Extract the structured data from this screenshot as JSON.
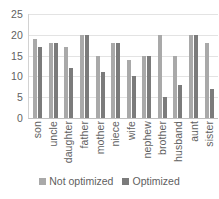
{
  "chart_data": {
    "type": "bar",
    "title": "",
    "xlabel": "",
    "ylabel": "",
    "ylim": [
      0,
      25
    ],
    "yticks": [
      0,
      5,
      10,
      15,
      20,
      25
    ],
    "grid": true,
    "legend_position": "bottom",
    "categories": [
      "son",
      "uncle",
      "daughter",
      "father",
      "mother",
      "niece",
      "wife",
      "nephew",
      "brother",
      "husband",
      "aunt",
      "sister"
    ],
    "series": [
      {
        "name": "Not optimized",
        "color": "#a9a9a9",
        "values": [
          19,
          18,
          17,
          20,
          15,
          18,
          14,
          15,
          20,
          15,
          20,
          18
        ]
      },
      {
        "name": "Optimized",
        "color": "#7b7b7b",
        "values": [
          17,
          18,
          12,
          20,
          11,
          18,
          10,
          15,
          5,
          8,
          20,
          7
        ]
      }
    ]
  }
}
